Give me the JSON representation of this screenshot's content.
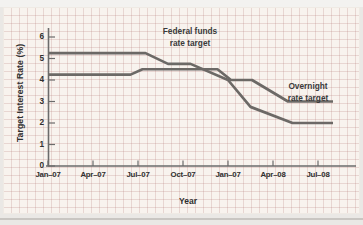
{
  "figure": {
    "page_bg": "#eae8e5",
    "panel_bg": "#f8f3ee",
    "grid_style": "graph-paper squares",
    "axis_color": "#6b6b6b",
    "text_color": "#2f2f2f"
  },
  "chart_data": {
    "type": "line",
    "title": "",
    "xlabel": "Year",
    "ylabel": "Target Interest Rate (%)",
    "x_unit": "months since Jan-2007",
    "xlim_months": [
      0,
      19.5
    ],
    "ylim": [
      0,
      6
    ],
    "grid": "background graph paper (no plot gridlines)",
    "legend_position": "inline annotations near lines",
    "y_ticks": [
      0,
      1,
      2,
      3,
      4,
      5,
      6
    ],
    "x_ticks": [
      {
        "month": 0,
        "label": "Jan–07"
      },
      {
        "month": 3,
        "label": "Apr–07"
      },
      {
        "month": 6,
        "label": "Jul–07"
      },
      {
        "month": 9,
        "label": "Oct–07"
      },
      {
        "month": 12,
        "label": "Jan–07"
      },
      {
        "month": 15,
        "label": "Apr–08"
      },
      {
        "month": 18,
        "label": "Jul–08"
      }
    ],
    "series": [
      {
        "name": "Federal funds rate target",
        "label": "Federal funds\nrate target",
        "color": "#6c6966",
        "points_month_rate": [
          [
            0,
            5.25
          ],
          [
            6.5,
            5.25
          ],
          [
            8,
            4.75
          ],
          [
            9.5,
            4.75
          ],
          [
            12,
            4.0
          ],
          [
            13.5,
            2.75
          ],
          [
            16.3,
            2.0
          ],
          [
            19.0,
            2.0
          ]
        ]
      },
      {
        "name": "Overnight rate target",
        "label": "Overnight\nrate target",
        "color": "#6c6966",
        "points_month_rate": [
          [
            0,
            4.25
          ],
          [
            5.5,
            4.25
          ],
          [
            6.3,
            4.5
          ],
          [
            11.3,
            4.5
          ],
          [
            12.2,
            4.0
          ],
          [
            13.6,
            4.0
          ],
          [
            16,
            3.0
          ],
          [
            19.0,
            3.0
          ]
        ]
      }
    ]
  }
}
